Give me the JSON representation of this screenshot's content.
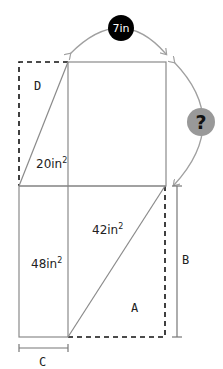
{
  "diagram": {
    "top_dimension": {
      "label": "7in",
      "badge_color": "#000000",
      "text_color": "#ffffff"
    },
    "side_dimension": {
      "label": "?",
      "badge_color": "#999999",
      "text_color": "#111111"
    },
    "regions": {
      "D": {
        "label": "D"
      },
      "upper_left_triangle": {
        "area": "20in",
        "exp": "2"
      },
      "lower_left_rect": {
        "area": "48in",
        "exp": "2"
      },
      "lower_right_triangle": {
        "area": "42in",
        "exp": "2"
      },
      "A": {
        "label": "A"
      }
    },
    "brackets": {
      "B": {
        "label": "B"
      },
      "C": {
        "label": "C"
      }
    },
    "colors": {
      "solid_line": "#8a8a8a",
      "dashed_line": "#111111",
      "arc": "#a0a0a0"
    }
  }
}
